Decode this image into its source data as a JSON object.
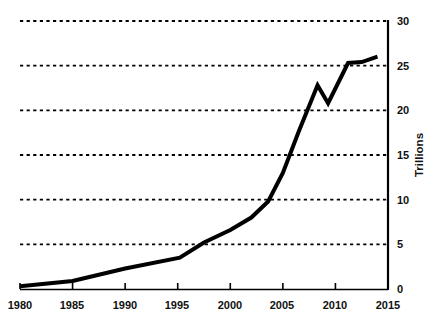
{
  "chart_data": {
    "type": "line",
    "title": "",
    "subtitle": "",
    "xlabel": "",
    "ylabel": "Trillions",
    "xlim": [
      1980,
      2015
    ],
    "ylim": [
      0,
      30
    ],
    "grid": "horizontal-dashed",
    "legend": "none",
    "y_axis_position": "right",
    "x_ticks": [
      "1980",
      "1985",
      "1990",
      "1995",
      "2000",
      "2005",
      "2010",
      "2015"
    ],
    "x_tick_values": [
      1980,
      1985,
      1990,
      1995,
      2000,
      2005,
      2010,
      2015
    ],
    "y_ticks": [
      "0",
      "5",
      "10",
      "15",
      "20",
      "25",
      "30"
    ],
    "y_tick_values": [
      0,
      5,
      10,
      15,
      20,
      25,
      30
    ],
    "line_color": "#000000",
    "line_width": 4,
    "grid_color": "#000000",
    "axis_color": "#000000",
    "series": [
      {
        "name": "Value",
        "x": [
          1980,
          1985,
          1990,
          1995.2,
          1997.5,
          2000,
          2002,
          2003.6,
          2005,
          2006.5,
          2008.3,
          2009.3,
          2011.2,
          2012.5,
          2014
        ],
        "values": [
          0.3,
          0.9,
          2.3,
          3.5,
          5.2,
          6.6,
          8.0,
          9.8,
          13.0,
          17.6,
          22.8,
          20.8,
          25.3,
          25.4,
          26.0
        ]
      }
    ]
  },
  "axes": {
    "y_title": "Trillions"
  }
}
